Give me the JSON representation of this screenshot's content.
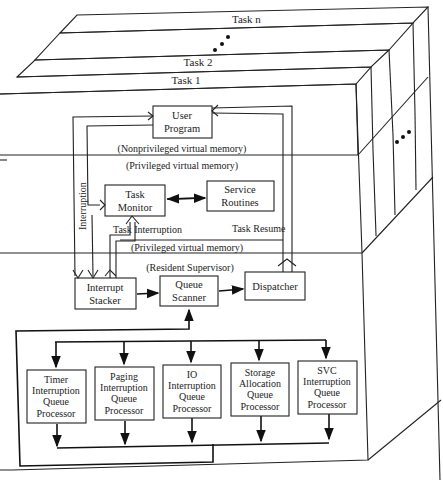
{
  "diagram": {
    "layers": {
      "task_n": "Task n",
      "task_2": "Task 2",
      "task_1": "Task 1"
    },
    "regions": {
      "nonprivileged": "(Nonprivileged virtual memory)",
      "privileged_top": "(Privileged virtual memory)",
      "privileged_mid": "(Privileged virtual memory)",
      "resident": "(Resident Supervisor)"
    },
    "boxes": {
      "user_program": [
        "User",
        "Program"
      ],
      "task_monitor": [
        "Task",
        "Monitor"
      ],
      "service_routines": [
        "Service",
        "Routines"
      ],
      "interrupt_stacker": [
        "Interrupt",
        "Stacker"
      ],
      "queue_scanner": [
        "Queue",
        "Scanner"
      ],
      "dispatcher": [
        "Dispatcher"
      ]
    },
    "flow_labels": {
      "interruption": "Interruption",
      "task_interruption": "Task Interruption",
      "task_resume": "Task Resume"
    },
    "processors": [
      [
        "Timer",
        "Interruption",
        "Queue",
        "Processor"
      ],
      [
        "Paging",
        "Interruption",
        "Queue",
        "Processor"
      ],
      [
        "IO",
        "Interruption",
        "Queue",
        "Processor"
      ],
      [
        "Storage",
        "Allocation",
        "Queue",
        "Processor"
      ],
      [
        "SVC",
        "Interruption",
        "Queue",
        "Processor"
      ]
    ],
    "ellipsis": "• • •"
  }
}
